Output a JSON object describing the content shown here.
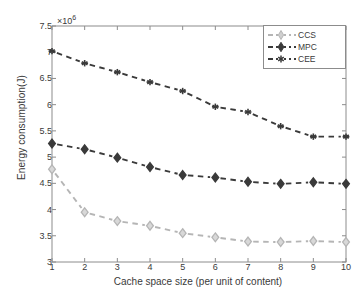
{
  "chart_data": {
    "type": "line",
    "title": "",
    "xlabel": "Cache space size (per unit of content)",
    "ylabel": "Energy consumption(J)",
    "y_exponent_label": "×10",
    "y_exponent_power": "6",
    "xlim": [
      1,
      10
    ],
    "ylim": [
      3,
      7.5
    ],
    "x": [
      1,
      2,
      3,
      4,
      5,
      6,
      7,
      8,
      9,
      10
    ],
    "xticks": [
      "1",
      "2",
      "3",
      "4",
      "5",
      "6",
      "7",
      "8",
      "9",
      "10"
    ],
    "yticks": [
      "3",
      "3.5",
      "4",
      "4.5",
      "5",
      "5.5",
      "6",
      "6.5",
      "7",
      "7.5"
    ],
    "ytick_values": [
      3,
      3.5,
      4,
      4.5,
      5,
      5.5,
      6,
      6.5,
      7,
      7.5
    ],
    "grid": false,
    "legend_position": "top-right",
    "series": [
      {
        "name": "CCS",
        "color": "#b5b5b5",
        "marker": "diamond-open",
        "linestyle": "dashed",
        "values": [
          4.77,
          3.95,
          3.78,
          3.69,
          3.55,
          3.47,
          3.39,
          3.38,
          3.4,
          3.38
        ]
      },
      {
        "name": "MPC",
        "color": "#3a3a3a",
        "marker": "diamond-filled",
        "linestyle": "dashed",
        "values": [
          5.26,
          5.15,
          4.99,
          4.81,
          4.66,
          4.61,
          4.53,
          4.49,
          4.52,
          4.49
        ]
      },
      {
        "name": "CEE",
        "color": "#3a3a3a",
        "marker": "asterisk",
        "linestyle": "dashed",
        "values": [
          7.02,
          6.79,
          6.62,
          6.43,
          6.26,
          5.96,
          5.86,
          5.59,
          5.39,
          5.39
        ]
      }
    ]
  },
  "legend": {
    "items": [
      {
        "label": "CCS"
      },
      {
        "label": "MPC"
      },
      {
        "label": "CEE"
      }
    ]
  },
  "axis": {
    "box_color": "#8c8c8c",
    "text_color": "#3a3a3a"
  }
}
